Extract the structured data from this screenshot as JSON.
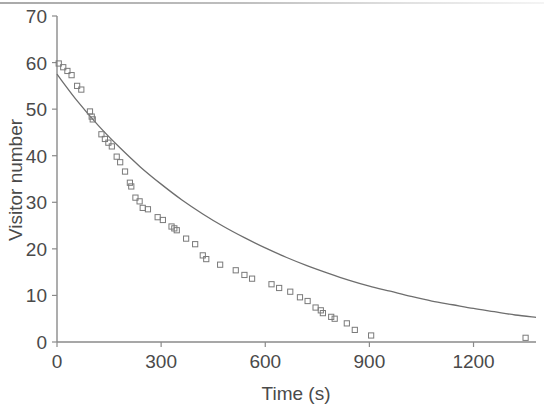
{
  "figure": {
    "name": "visitor-number-decay-plot",
    "background_color": "#ffffff",
    "axis_color": "#8a8a8a",
    "marker_color": "#7a7a7a",
    "curve_color": "#6e6e6e",
    "text_color": "#4a4a4a"
  },
  "chart_data": {
    "type": "scatter",
    "title": "",
    "subtitle": "",
    "xlabel": "Time (s)",
    "ylabel": "Visitor number",
    "xlim": [
      0,
      1380
    ],
    "ylim": [
      0,
      70
    ],
    "xticks": [
      0,
      300,
      600,
      900,
      1200
    ],
    "yticks": [
      0,
      10,
      20,
      30,
      40,
      50,
      60,
      70
    ],
    "xtick_labels": [
      "0",
      "300",
      "600",
      "900",
      "1200"
    ],
    "ytick_labels": [
      "0",
      "10",
      "20",
      "30",
      "40",
      "50",
      "60",
      "70"
    ],
    "grid": false,
    "legend": null,
    "legend_position": "none",
    "marker_style": "open-square",
    "series": [
      {
        "name": "Observed visitor number",
        "type": "scatter",
        "points": [
          [
            5,
            59.8
          ],
          [
            18,
            59.0
          ],
          [
            30,
            58.2
          ],
          [
            42,
            57.3
          ],
          [
            58,
            55.0
          ],
          [
            70,
            54.2
          ],
          [
            95,
            49.5
          ],
          [
            100,
            48.4
          ],
          [
            103,
            47.8
          ],
          [
            128,
            44.6
          ],
          [
            138,
            43.6
          ],
          [
            148,
            42.8
          ],
          [
            158,
            42.0
          ],
          [
            172,
            39.8
          ],
          [
            182,
            38.6
          ],
          [
            196,
            36.6
          ],
          [
            210,
            34.2
          ],
          [
            214,
            33.4
          ],
          [
            226,
            31.0
          ],
          [
            238,
            30.2
          ],
          [
            247,
            28.8
          ],
          [
            262,
            28.5
          ],
          [
            290,
            26.8
          ],
          [
            305,
            26.2
          ],
          [
            330,
            24.8
          ],
          [
            338,
            24.4
          ],
          [
            345,
            24.0
          ],
          [
            372,
            22.2
          ],
          [
            398,
            21.0
          ],
          [
            420,
            18.6
          ],
          [
            430,
            17.8
          ],
          [
            470,
            16.6
          ],
          [
            515,
            15.4
          ],
          [
            540,
            14.4
          ],
          [
            562,
            13.6
          ],
          [
            618,
            12.4
          ],
          [
            640,
            11.6
          ],
          [
            672,
            10.8
          ],
          [
            700,
            9.6
          ],
          [
            722,
            8.8
          ],
          [
            745,
            7.4
          ],
          [
            760,
            6.8
          ],
          [
            766,
            6.2
          ],
          [
            790,
            5.4
          ],
          [
            800,
            5.0
          ],
          [
            835,
            4.0
          ],
          [
            858,
            2.6
          ],
          [
            905,
            1.4
          ],
          [
            1350,
            0.9
          ]
        ]
      },
      {
        "name": "Exponential fit",
        "type": "line",
        "model": "exponential decay",
        "fit_points": [
          [
            0,
            57.5
          ],
          [
            60,
            51.6
          ],
          [
            120,
            46.4
          ],
          [
            180,
            41.8
          ],
          [
            240,
            37.6
          ],
          [
            300,
            33.9
          ],
          [
            360,
            30.5
          ],
          [
            420,
            27.5
          ],
          [
            480,
            24.8
          ],
          [
            540,
            22.4
          ],
          [
            600,
            20.2
          ],
          [
            660,
            18.2
          ],
          [
            720,
            16.4
          ],
          [
            780,
            14.8
          ],
          [
            840,
            13.3
          ],
          [
            900,
            12.0
          ],
          [
            960,
            10.9
          ],
          [
            1020,
            9.8
          ],
          [
            1080,
            8.8
          ],
          [
            1140,
            8.0
          ],
          [
            1200,
            7.2
          ],
          [
            1260,
            6.5
          ],
          [
            1320,
            5.8
          ],
          [
            1380,
            5.3
          ]
        ]
      }
    ]
  }
}
